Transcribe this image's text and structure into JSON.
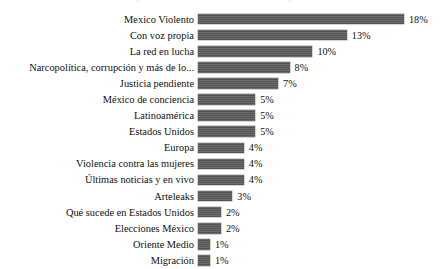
{
  "clipped_title": "que no se alcanza a leer en el recorte superior",
  "chart_data": {
    "type": "bar",
    "orientation": "horizontal",
    "title": "",
    "subtitle": "",
    "xlabel": "",
    "ylabel": "",
    "xlim": [
      0,
      18
    ],
    "grid": false,
    "legend": false,
    "value_suffix": "%",
    "bar_color": "#595959",
    "background_color": "#ffffff",
    "categories": [
      "Mexico Violento",
      "Con voz propia",
      "La red en lucha",
      "Narcopolítica, corrupción y más de lo...",
      "Justicia pendiente",
      "México de conciencia",
      "Latinoamérica",
      "Estados Unidos",
      "Europa",
      "Violencia contra las mujeres",
      "Últimas noticias y en vivo",
      "Arteleaks",
      "Qué sucede en Estados Unidos",
      "Elecciones México",
      "Oriente Medio",
      "Migración"
    ],
    "values": [
      18,
      13,
      10,
      8,
      7,
      5,
      5,
      5,
      4,
      4,
      4,
      3,
      2,
      2,
      1,
      1
    ],
    "value_labels": [
      "18%",
      "13%",
      "10%",
      "8%",
      "7%",
      "5%",
      "5%",
      "5%",
      "4%",
      "4%",
      "4%",
      "3%",
      "2%",
      "2%",
      "1%",
      "1%"
    ]
  }
}
